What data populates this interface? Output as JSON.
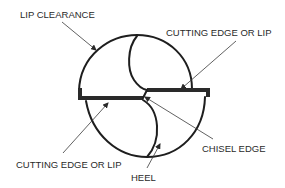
{
  "diagram": {
    "labels": {
      "lip_clearance": "LIP CLEARANCE",
      "cutting_edge_top": "CUTTING EDGE OR LIP",
      "cutting_edge_bottom": "CUTTING EDGE OR LIP",
      "chisel_edge": "CHISEL EDGE",
      "heel": "HEEL"
    },
    "colors": {
      "line": "#1e1e1e",
      "text": "#2a2a2a",
      "background": "#ffffff"
    }
  }
}
